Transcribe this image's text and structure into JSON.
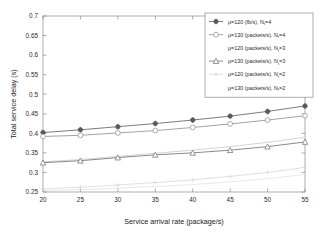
{
  "chart_data": {
    "type": "line",
    "title": "",
    "xlabel": "Service arrival rate (package/s)",
    "ylabel": "Total service delay (s)",
    "x": [
      20,
      25,
      30,
      35,
      40,
      45,
      50,
      55
    ],
    "xlim": [
      20,
      55
    ],
    "ylim": [
      0.25,
      0.7
    ],
    "xticks": [
      "20",
      "25",
      "30",
      "35",
      "40",
      "45",
      "50",
      "55"
    ],
    "yticks": [
      "0.25",
      "0.3",
      "0.35",
      "0.4",
      "0.45",
      "0.5",
      "0.55",
      "0.6",
      "0.65",
      "0.7"
    ],
    "grid": false,
    "legend_position": "top-right",
    "series": [
      {
        "name": "mu=120 (fb/s), N_t=4",
        "label_main": "=120 (fb/s), N",
        "label_mu": "μ",
        "label_sub": "t",
        "label_tail": "=4",
        "marker": "filled-star",
        "color": "#5a5a5a",
        "values": [
          0.402,
          0.409,
          0.417,
          0.425,
          0.434,
          0.444,
          0.456,
          0.47
        ]
      },
      {
        "name": "mu=130 (packets/s), N_t=4",
        "label_main": "=130 (packets/s), N",
        "label_mu": "μ",
        "label_sub": "t",
        "label_tail": "=4",
        "marker": "open-circle",
        "color": "#8c8c8c",
        "values": [
          0.392,
          0.395,
          0.401,
          0.407,
          0.415,
          0.424,
          0.434,
          0.445
        ]
      },
      {
        "name": "mu=120 (packets/s), N_t=3",
        "label_main": "=120 (packets/s), N",
        "label_mu": "μ",
        "label_sub": "t",
        "label_tail": "=3",
        "marker": "none",
        "color": "#c9c9c9",
        "values": [
          0.327,
          0.333,
          0.341,
          0.349,
          0.357,
          0.366,
          0.377,
          0.39
        ]
      },
      {
        "name": "mu=130 (packets/s), N_t=3",
        "label_main": "=130 (packets/s), N",
        "label_mu": "μ",
        "label_sub": "t",
        "label_tail": "=3",
        "marker": "open-triangle",
        "color": "#6b6b6b",
        "values": [
          0.325,
          0.33,
          0.338,
          0.345,
          0.35,
          0.357,
          0.366,
          0.378
        ]
      },
      {
        "name": "mu=120 (packets/s), N_t=2",
        "label_main": "=120 (packets/s), N",
        "label_mu": "μ",
        "label_sub": "t",
        "label_tail": "=2",
        "marker": "plus",
        "color": "#d8d8d8",
        "values": [
          0.258,
          0.262,
          0.268,
          0.274,
          0.281,
          0.29,
          0.3,
          0.313
        ]
      },
      {
        "name": "mu=130 (packets/s), N_t=2",
        "label_main": "=130 (packets/s), N",
        "label_mu": "μ",
        "label_sub": "t",
        "label_tail": "=2",
        "marker": "none",
        "color": "#e2e2e2",
        "values": [
          0.254,
          0.256,
          0.26,
          0.264,
          0.269,
          0.276,
          0.284,
          0.295
        ]
      }
    ]
  },
  "axes": {
    "xlabel": "Service arrival rate (package/s)",
    "ylabel": "Total service delay (s)"
  }
}
